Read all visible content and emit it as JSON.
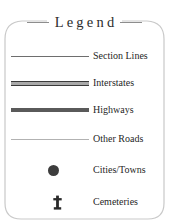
{
  "panel": {
    "title": "Legend",
    "border_color": "#c9c9c9",
    "background": "#ffffff",
    "rule_color": "#8d8d8d"
  },
  "entries": [
    {
      "label": "Section Lines",
      "symbol": "thin-medium-line",
      "color": "#6e6e6e"
    },
    {
      "label": "Interstates",
      "symbol": "thick-cased-line",
      "color": "#3a3a3a",
      "fill": "#a9a9a9"
    },
    {
      "label": "Highways",
      "symbol": "thick-solid-line",
      "color": "#5a5a5a"
    },
    {
      "label": "Other Roads",
      "symbol": "thin-light-line",
      "color": "#b2b2b2"
    },
    {
      "label": "Cities/Towns",
      "symbol": "filled-circle",
      "color": "#3d3d3d"
    },
    {
      "label": "Cemeteries",
      "symbol": "cross",
      "color": "#2a2a2a"
    }
  ]
}
